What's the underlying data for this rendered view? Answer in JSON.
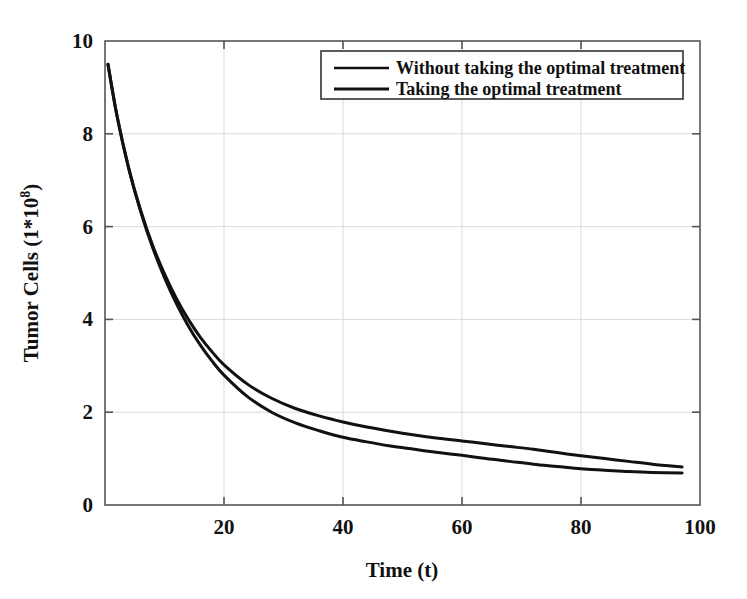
{
  "chart_data": {
    "type": "line",
    "title": "",
    "xlabel": "Time (t)",
    "ylabel": "Tumor Cells (1*10^8)",
    "ylabel_base": "Tumor Cells (1*10",
    "ylabel_exponent": "8",
    "ylabel_close": ")",
    "xlim": [
      0,
      100
    ],
    "ylim": [
      0,
      10
    ],
    "xticks": [
      20,
      40,
      60,
      80,
      100
    ],
    "xtick_labels": [
      "20",
      "40",
      "60",
      "80",
      "100"
    ],
    "yticks": [
      0,
      2,
      4,
      6,
      8,
      10
    ],
    "ytick_labels": [
      "0",
      "2",
      "4",
      "6",
      "8",
      "10"
    ],
    "grid": true,
    "grid_color": "#d9d9d9",
    "axis_color": "#555555",
    "line_color": "#111111",
    "line_width": 3,
    "legend_position": "top-right-inside",
    "legend_border_color": "#333333",
    "series": [
      {
        "name": "Without taking the optimal treatment",
        "x": [
          0.5,
          2,
          4,
          6,
          8,
          10,
          12,
          14,
          16,
          18,
          20,
          24,
          28,
          32,
          36,
          40,
          44,
          48,
          52,
          56,
          60,
          64,
          68,
          72,
          76,
          80,
          84,
          88,
          92,
          97
        ],
        "values": [
          9.5,
          8.4,
          7.25,
          6.35,
          5.6,
          4.98,
          4.45,
          4.0,
          3.62,
          3.3,
          3.02,
          2.6,
          2.3,
          2.08,
          1.92,
          1.79,
          1.68,
          1.59,
          1.51,
          1.44,
          1.38,
          1.32,
          1.26,
          1.2,
          1.13,
          1.06,
          1.0,
          0.94,
          0.88,
          0.82
        ]
      },
      {
        "name": "Taking the optimal treatment",
        "x": [
          0.5,
          2,
          4,
          6,
          8,
          10,
          12,
          14,
          16,
          18,
          20,
          24,
          28,
          32,
          36,
          40,
          44,
          48,
          52,
          56,
          60,
          64,
          68,
          72,
          76,
          80,
          84,
          88,
          92,
          97
        ],
        "values": [
          9.5,
          8.4,
          7.25,
          6.32,
          5.55,
          4.9,
          4.34,
          3.86,
          3.45,
          3.1,
          2.8,
          2.33,
          2.0,
          1.77,
          1.6,
          1.46,
          1.36,
          1.27,
          1.2,
          1.13,
          1.07,
          1.0,
          0.94,
          0.88,
          0.83,
          0.78,
          0.75,
          0.72,
          0.7,
          0.69
        ]
      }
    ]
  },
  "legend": {
    "items": [
      {
        "label": "Without taking the optimal treatment"
      },
      {
        "label": "Taking the optimal treatment"
      }
    ]
  }
}
